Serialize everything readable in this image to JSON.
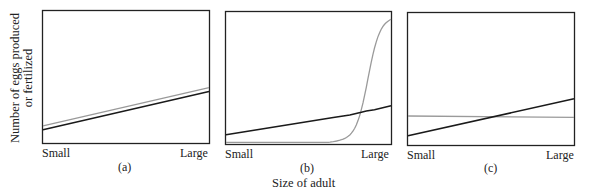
{
  "figure": {
    "ylabel_line1": "Number of eggs produced",
    "ylabel_line2": "or fertilized",
    "xlabel": "Size of adult",
    "panels": [
      {
        "label": "(a)",
        "x_min_label": "Small",
        "x_max_label": "Large"
      },
      {
        "label": "(b)",
        "x_min_label": "Small",
        "x_max_label": "Large"
      },
      {
        "label": "(c)",
        "x_min_label": "Small",
        "x_max_label": "Large"
      }
    ],
    "colors": {
      "female_line": "#1a1a1a",
      "male_line": "#9a9a9a",
      "frame": "#222222"
    }
  },
  "chart_data": [
    {
      "type": "line",
      "title": "(a)",
      "xlabel": "Size of adult",
      "ylabel": "Number of eggs produced or fertilized",
      "x": [
        "Small",
        "Large"
      ],
      "series": [
        {
          "name": "dark line",
          "values": [
            0.1,
            0.39
          ]
        },
        {
          "name": "gray line",
          "values": [
            0.13,
            0.42
          ]
        }
      ],
      "ylim": [
        0,
        1
      ],
      "grid": false
    },
    {
      "type": "line",
      "title": "(b)",
      "xlabel": "Size of adult",
      "ylabel": "Number of eggs produced or fertilized",
      "x": [
        0,
        0.65,
        0.75,
        0.82,
        0.85,
        0.9,
        1.0
      ],
      "series": [
        {
          "name": "dark line",
          "values": [
            0.07,
            0.2,
            0.22,
            0.24,
            0.25,
            0.26,
            0.29
          ]
        },
        {
          "name": "gray line",
          "values": [
            0.01,
            0.01,
            0.03,
            0.1,
            0.25,
            0.6,
            0.97
          ]
        }
      ],
      "ylim": [
        0,
        1
      ],
      "grid": false
    },
    {
      "type": "line",
      "title": "(c)",
      "xlabel": "Size of adult",
      "ylabel": "Number of eggs produced or fertilized",
      "x": [
        "Small",
        "Large"
      ],
      "series": [
        {
          "name": "dark line",
          "values": [
            0.07,
            0.35
          ]
        },
        {
          "name": "gray line",
          "values": [
            0.22,
            0.21
          ]
        }
      ],
      "ylim": [
        0,
        1
      ],
      "grid": false
    }
  ]
}
